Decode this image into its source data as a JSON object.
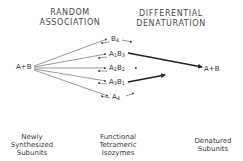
{
  "headers": {
    "left": [
      "RANDOM",
      "ASSOCIATION"
    ],
    "right": [
      "DIFFERENTIAL",
      "DENATURATION"
    ]
  },
  "source_node": "A+B",
  "product_node": "A+B",
  "isozymes": [
    {
      "name": "B4",
      "base": "B",
      "sub": "4"
    },
    {
      "name": "A1B3",
      "a_sub": "1",
      "b_sub": "3"
    },
    {
      "name": "A2B2",
      "a_sub": "2",
      "b_sub": "2"
    },
    {
      "name": "A3B1",
      "a_sub": "3",
      "b_sub": "1"
    },
    {
      "name": "A4",
      "base": "A",
      "sub": "4"
    }
  ],
  "footer": {
    "left": [
      "Newly",
      "Synthesized",
      "Subunits"
    ],
    "middle": [
      "Functional",
      "Tetrameric",
      "Isozymes"
    ],
    "right": [
      "Denatured",
      "Subunits"
    ]
  },
  "colors": {
    "line": "#444444",
    "bold_arrow": "#222222"
  }
}
